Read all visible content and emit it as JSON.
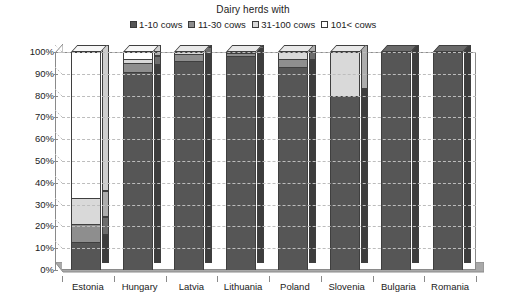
{
  "chart_data": {
    "type": "bar",
    "subtype": "stacked-100-percent-3d",
    "title": "Dairy herds with",
    "xlabel": "",
    "ylabel": "",
    "ylim": [
      0,
      100
    ],
    "ytick_labels": [
      "0%",
      "10%",
      "20%",
      "30%",
      "40%",
      "50%",
      "60%",
      "70%",
      "80%",
      "90%",
      "100%"
    ],
    "ytick_values": [
      0,
      10,
      20,
      30,
      40,
      50,
      60,
      70,
      80,
      90,
      100
    ],
    "grid": true,
    "legend_position": "top-center",
    "categories": [
      "Estonia",
      "Hungary",
      "Latvia",
      "Lithuania",
      "Poland",
      "Slovenia",
      "Bulgaria",
      "Romania"
    ],
    "series": [
      {
        "name": "1-10 cows",
        "color": "#565656",
        "values": [
          13,
          91,
          96,
          98,
          93,
          80,
          100,
          100
        ]
      },
      {
        "name": "11-30 cows",
        "color": "#8e8e8e",
        "values": [
          8,
          4,
          3,
          1.5,
          4,
          0,
          0,
          0
        ]
      },
      {
        "name": "31-100 cows",
        "color": "#d9d9d9",
        "values": [
          12,
          2,
          1,
          0.5,
          3,
          20,
          0,
          0
        ]
      },
      {
        "name": "101< cows",
        "color": "#ffffff",
        "values": [
          67,
          3,
          0,
          0,
          0,
          0,
          0,
          0
        ]
      }
    ]
  },
  "legend": {
    "items": [
      {
        "label": "1-10 cows",
        "swatch": "legend-swatch-dark"
      },
      {
        "label": "11-30 cows",
        "swatch": "legend-swatch-medium"
      },
      {
        "label": "31-100 cows",
        "swatch": "legend-swatch-light"
      },
      {
        "label": "101< cows",
        "swatch": "legend-swatch-white"
      }
    ]
  }
}
